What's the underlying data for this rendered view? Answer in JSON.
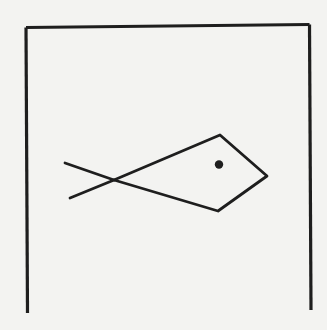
{
  "figure": {
    "description": "Hand-drawn line sketch of a fish inside a three-sided frame open at the bottom",
    "subject": "fish",
    "colors": {
      "background": "#f3f3f1",
      "ink": "#1e1e1e"
    },
    "frame": {
      "sides": [
        "left",
        "top",
        "right"
      ],
      "open_side": "bottom"
    },
    "icons": {
      "fish": "fish-icon",
      "eye": "eye-dot-icon"
    }
  }
}
